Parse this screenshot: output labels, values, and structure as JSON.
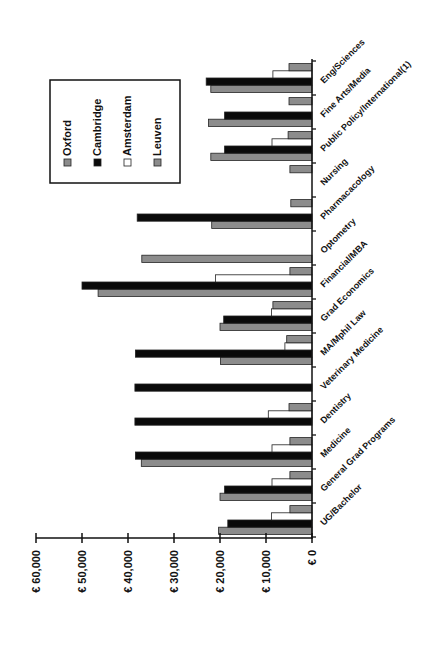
{
  "chart_data": {
    "type": "bar",
    "orientation": "rotated-90-ccw (bars extend leftward from baseline, value axis along bottom)",
    "title": "",
    "xlabel": "",
    "ylabel": "",
    "value_axis": {
      "ticks": [
        "€ 0",
        "€ 10,000",
        "€ 20,000",
        "€ 30,000",
        "€ 40,000",
        "€ 50,000",
        "€ 60,000"
      ],
      "tick_values": [
        0,
        10000,
        20000,
        30000,
        40000,
        50000,
        60000
      ],
      "range": [
        0,
        60000
      ]
    },
    "grid": false,
    "legend_position": "upper-left (rotated)",
    "categories": [
      "UG/Bachelor",
      "General Grad Programs",
      "Medicine",
      "Dentistry",
      "Veterinary Medicine",
      "MA/Mphil Law",
      "Grad Economics",
      "Financial/MBA",
      "Optometry",
      "Pharmacacology",
      "Nursing",
      "Public Policy/International(1)",
      "Fine Arts/Media",
      "Eng/Sciences"
    ],
    "series": [
      {
        "name": "Oxford",
        "color": "#8c8c8c",
        "values": [
          20300,
          20000,
          37100,
          null,
          null,
          19900,
          20000,
          46500,
          37000,
          21800,
          null,
          22000,
          22500,
          22000
        ]
      },
      {
        "name": "Cambridge",
        "color": "#0a0a0a",
        "values": [
          18300,
          19000,
          38400,
          38500,
          38500,
          38400,
          19200,
          50000,
          null,
          38000,
          null,
          19000,
          19000,
          23000
        ]
      },
      {
        "name": "Amsterdam",
        "color": "#ffffff",
        "values": [
          8800,
          8700,
          8700,
          9500,
          null,
          5900,
          8800,
          21000,
          null,
          null,
          null,
          8700,
          null,
          8500
        ]
      },
      {
        "name": "Leuven",
        "color": "#8c8c8c",
        "values": [
          4800,
          4800,
          4800,
          5000,
          null,
          5500,
          8500,
          4800,
          null,
          4600,
          4800,
          5200,
          5000,
          5000
        ]
      }
    ]
  },
  "legend": {
    "items": [
      {
        "label": "Oxford",
        "swatch": "#8c8c8c"
      },
      {
        "label": "Cambridge",
        "swatch": "#0a0a0a"
      },
      {
        "label": "Amsterdam",
        "swatch": "#ffffff"
      },
      {
        "label": "Leuven",
        "swatch": "#8c8c8c"
      }
    ]
  }
}
